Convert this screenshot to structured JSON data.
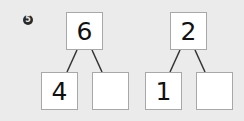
{
  "problem": {
    "number_badge": "5"
  },
  "bonds": [
    {
      "whole": "6",
      "parts": [
        "4",
        ""
      ]
    },
    {
      "whole": "2",
      "parts": [
        "1",
        ""
      ]
    }
  ],
  "colors": {
    "background": "#ebebeb",
    "box_fill": "#ffffff",
    "box_border": "#a8a8a8",
    "line": "#333333",
    "badge": "#2a2a2a"
  }
}
